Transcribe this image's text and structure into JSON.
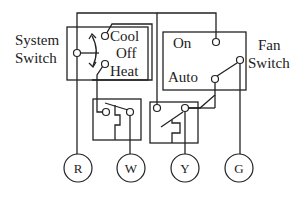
{
  "diagram": {
    "type": "thermostat wiring diagram",
    "system_switch": {
      "label_line1": "System",
      "label_line2": "Switch",
      "positions": [
        "Cool",
        "Off",
        "Heat"
      ]
    },
    "fan_switch": {
      "label_line1": "Fan",
      "label_line2": "Switch",
      "positions": [
        "On",
        "Auto"
      ]
    },
    "terminals": [
      "R",
      "W",
      "Y",
      "G"
    ],
    "colors": {
      "line": "#222222",
      "background": "#ffffff"
    }
  }
}
